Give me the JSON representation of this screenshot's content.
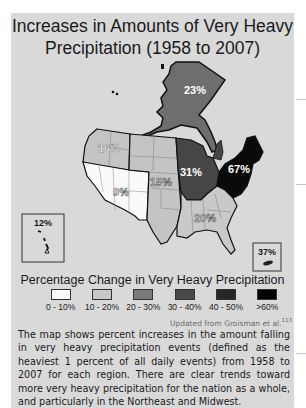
{
  "title": {
    "line1": "Increases in Amounts of Very Heavy",
    "line2": "Precipitation (1958 to 2007)"
  },
  "regions": [
    {
      "name": "Alaska",
      "value": "23%",
      "color": "#6e6e6e",
      "label_color": "#ffffff"
    },
    {
      "name": "Northwest",
      "value": "16%",
      "color": "#c4c4c4",
      "label_color": "#ffffff"
    },
    {
      "name": "Southwest",
      "value": "9%",
      "color": "#fafafa",
      "label_color": "#555555"
    },
    {
      "name": "Great Plains",
      "value": "15%",
      "color": "#c4c4c4",
      "label_color": "#555555"
    },
    {
      "name": "Midwest",
      "value": "31%",
      "color": "#464646",
      "label_color": "#ffffff"
    },
    {
      "name": "Northeast",
      "value": "67%",
      "color": "#0a0a0a",
      "label_color": "#ffffff"
    },
    {
      "name": "Southeast",
      "value": "20%",
      "color": "#c9c9c9",
      "label_color": "#555555"
    },
    {
      "name": "Hawaii",
      "value": "12%",
      "color": "#fafafa",
      "label_color": "#1a1a1a"
    },
    {
      "name": "Puerto Rico",
      "value": "37%",
      "color": "#464646",
      "label_color": "#1a1a1a"
    }
  ],
  "legend": {
    "title": "Percentage Change in Very Heavy Precipitation",
    "items": [
      {
        "label": "0 - 10%",
        "color": "#fafafa"
      },
      {
        "label": "10 - 20%",
        "color": "#c8c8c8"
      },
      {
        "label": "20 - 30%",
        "color": "#7a7a7a"
      },
      {
        "label": "30 - 40%",
        "color": "#4a4a4a"
      },
      {
        "label": "40 - 50%",
        "color": "#262626"
      },
      {
        "label": ">60%",
        "color": "#050505"
      }
    ]
  },
  "credit": {
    "text": "Updated from Groisman et al.",
    "ref": "113"
  },
  "caption": "The map shows percent increases in the amount falling in very heavy precipitation events (defined as the heaviest 1 percent of all daily events) from 1958 to 2007 for each region. There are clear trends toward more very heavy precipitation for the nation as a whole, and particularly in the Northeast and Midwest."
}
